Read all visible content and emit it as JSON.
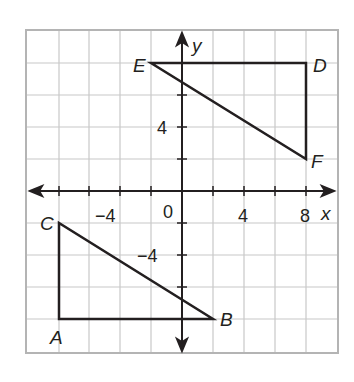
{
  "diagram": {
    "type": "coordinate-plane",
    "axes": {
      "x_label": "x",
      "y_label": "y",
      "origin_label": "0",
      "x_range": [
        -10,
        10
      ],
      "y_range": [
        -10,
        10
      ],
      "grid_step": 2,
      "x_tick_labels": [
        {
          "value": -4,
          "text": "−4"
        },
        {
          "value": 4,
          "text": "4"
        },
        {
          "value": 8,
          "text": "8"
        }
      ],
      "y_tick_labels": [
        {
          "value": 4,
          "text": "4"
        },
        {
          "value": -4,
          "text": "−4"
        }
      ]
    },
    "triangles": [
      {
        "name": "ABC",
        "vertices": [
          {
            "label": "A",
            "x": -8,
            "y": -8
          },
          {
            "label": "B",
            "x": 2,
            "y": -8
          },
          {
            "label": "C",
            "x": -8,
            "y": -2
          }
        ]
      },
      {
        "name": "DEF",
        "vertices": [
          {
            "label": "D",
            "x": 8,
            "y": 8
          },
          {
            "label": "E",
            "x": -2,
            "y": 8
          },
          {
            "label": "F",
            "x": 8,
            "y": 2
          }
        ]
      }
    ],
    "colors": {
      "grid": "#c8c8c8",
      "border": "#b4b4b4",
      "axis": "#231f20",
      "shape": "#231f20"
    }
  }
}
